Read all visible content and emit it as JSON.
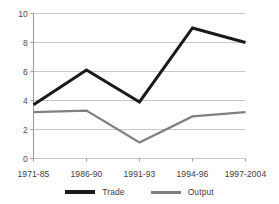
{
  "chart_data": {
    "type": "line",
    "title": "",
    "subtitle": "",
    "xlabel": "",
    "ylabel": "",
    "categories": [
      "1971-85",
      "1986-90",
      "1991-93",
      "1994-96",
      "1997-2004"
    ],
    "series": [
      {
        "name": "Trade",
        "values": [
          3.7,
          6.1,
          3.9,
          9.0,
          8.0
        ],
        "color": "#1a1a1a"
      },
      {
        "name": "Output",
        "values": [
          3.2,
          3.3,
          1.1,
          2.9,
          3.2
        ],
        "color": "#808080"
      }
    ],
    "ylim": [
      0,
      10
    ],
    "yticks": [
      0,
      2,
      4,
      6,
      8,
      10
    ],
    "ytick_labels": [
      "0",
      "2",
      "4",
      "6",
      "8",
      "10"
    ],
    "grid": "horizontal",
    "legend_position": "bottom",
    "legend": [
      {
        "label": "Trade",
        "color": "#1a1a1a"
      },
      {
        "label": "Output",
        "color": "#808080"
      }
    ],
    "colors": {
      "grid": "#c8c8c8",
      "axis": "#9a9a9a",
      "text": "#3d3d3d",
      "background": "#ffffff",
      "trade": "#1a1a1a",
      "output": "#808080"
    }
  }
}
